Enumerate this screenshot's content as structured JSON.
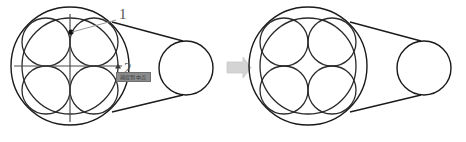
{
  "canvas": {
    "width": 466,
    "height": 142,
    "background": "#ffffff"
  },
  "colors": {
    "stroke_dark": "#1a1a1a",
    "stroke_mid": "#3c3c3c",
    "axis": "#4a4a4a",
    "label": "#555555",
    "arrow_fill": "#d4d4d4",
    "arrow_stroke": "#c4c4c4",
    "tooltip_bg": "#8c8c8c",
    "tooltip_border": "#6e6e6e",
    "tooltip_text": "#3a3a3a",
    "snap_dot": "#111111"
  },
  "left_figure": {
    "name": "annotated-pulley-assembly",
    "outer_ring": {
      "cx": 70,
      "cy": 66,
      "r": 59
    },
    "inner_ring": {
      "cx": 70,
      "cy": 66,
      "r": 48
    },
    "strand_circles": [
      {
        "id": "strand-top-left",
        "cx": 46,
        "cy": 42,
        "r": 24
      },
      {
        "id": "strand-top-right",
        "cx": 94,
        "cy": 42,
        "r": 24
      },
      {
        "id": "strand-bottom-left",
        "cx": 46,
        "cy": 90,
        "r": 24
      },
      {
        "id": "strand-bottom-right",
        "cx": 94,
        "cy": 90,
        "r": 24
      }
    ],
    "pulley_circle": {
      "cx": 186,
      "cy": 68,
      "r": 27
    },
    "axes": {
      "vertical": {
        "x": 70,
        "y1": 14,
        "y2": 122
      },
      "horizontal": {
        "y": 66,
        "x1": 14,
        "x2": 122
      }
    },
    "snap_point": {
      "cx": 71,
      "cy": 32,
      "r": 2.6
    },
    "axis_end_marker": {
      "x": 118,
      "y": 66
    }
  },
  "right_figure": {
    "name": "result-pulley-assembly",
    "outer_ring": {
      "cx": 308,
      "cy": 66,
      "r": 59
    },
    "inner_ring": {
      "cx": 308,
      "cy": 66,
      "r": 48
    },
    "strand_circles": [
      {
        "id": "strand-top-left",
        "cx": 284,
        "cy": 42,
        "r": 24
      },
      {
        "id": "strand-top-right",
        "cx": 332,
        "cy": 42,
        "r": 24
      },
      {
        "id": "strand-bottom-left",
        "cx": 284,
        "cy": 90,
        "r": 24
      },
      {
        "id": "strand-bottom-right",
        "cx": 332,
        "cy": 90,
        "r": 24
      }
    ],
    "pulley_circle": {
      "cx": 424,
      "cy": 68,
      "r": 27
    }
  },
  "annotations": {
    "callout_1": {
      "text": "1",
      "x": 119,
      "y": 19,
      "leader": {
        "x1": 116,
        "y1": 20,
        "x2": 72,
        "y2": 32
      }
    },
    "callout_2": {
      "text": "2",
      "x": 124,
      "y": 73,
      "leader": {
        "x1": 122,
        "y1": 67,
        "x2": 117,
        "y2": 67
      }
    }
  },
  "tooltip": {
    "name": "snap-tooltip",
    "text": "捕捉到中点",
    "x": 116,
    "y": 72,
    "width": 35,
    "height": 10
  },
  "arrow": {
    "name": "transition-arrow",
    "x": 227,
    "y": 57,
    "width": 24,
    "height": 21,
    "direction": "right"
  }
}
